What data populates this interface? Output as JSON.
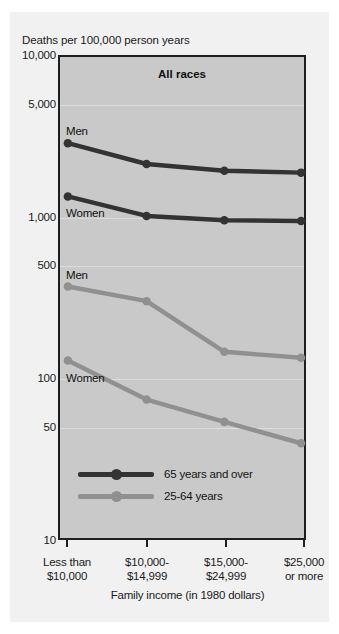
{
  "figure": {
    "y_axis_caption": "Deaths per 100,000 person years",
    "x_axis_title": "Family income (in 1980 dollars)"
  },
  "colors": {
    "plot_background": "#c9c9c9",
    "figure_background": "#f1f1f1",
    "series_65_and_over": "#333333",
    "series_25_to_64": "#909090",
    "frame": "#1f1f1f",
    "gridline": "#dcdcdc"
  },
  "legend": {
    "position": "inside-bottom-left",
    "items": [
      {
        "label": "65 years and over",
        "color": "#333333"
      },
      {
        "label": "25-64 years",
        "color": "#909090"
      }
    ]
  },
  "inline_labels": [
    {
      "text": "Men",
      "series": "65 years and over",
      "sex": "Men"
    },
    {
      "text": "Women",
      "series": "65 years and over",
      "sex": "Women"
    },
    {
      "text": "Men",
      "series": "25-64 years",
      "sex": "Men"
    },
    {
      "text": "Women",
      "series": "25-64 years",
      "sex": "Women"
    }
  ],
  "chart_data": {
    "type": "line",
    "title": "All races",
    "xlabel": "Family income (in 1980 dollars)",
    "ylabel": "Deaths per 100,000 person years",
    "yscale": "log",
    "ylim": [
      10,
      10000
    ],
    "ytick_values": [
      10000,
      5000,
      1000,
      500,
      100,
      50,
      10
    ],
    "ytick_labels": [
      "10,000",
      "5,000",
      "1,000",
      "500",
      "100",
      "50",
      "10"
    ],
    "grid": true,
    "categories": [
      "Less than $10,000",
      "$10,000-$14,999",
      "$15,000-$24,999",
      "$25,000 or more"
    ],
    "category_label_lines": [
      [
        "Less than",
        "$10,000"
      ],
      [
        "$10,000-",
        "$14,999"
      ],
      [
        "$15,000-",
        "$24,999"
      ],
      [
        "$25,000",
        "or more"
      ]
    ],
    "series": [
      {
        "name": "65 years and over, Men",
        "group": "65 years and over",
        "sex": "Men",
        "color": "#333333",
        "values": [
          2900,
          2150,
          1950,
          1900
        ]
      },
      {
        "name": "65 years and over, Women",
        "group": "65 years and over",
        "sex": "Women",
        "color": "#333333",
        "values": [
          1350,
          1020,
          960,
          950
        ]
      },
      {
        "name": "25-64 years, Men",
        "group": "25-64 years",
        "sex": "Men",
        "color": "#909090",
        "values": [
          370,
          300,
          145,
          133
        ]
      },
      {
        "name": "25-64 years, Women",
        "group": "25-64 years",
        "sex": "Women",
        "color": "#909090",
        "values": [
          128,
          73,
          53,
          39
        ]
      }
    ]
  }
}
